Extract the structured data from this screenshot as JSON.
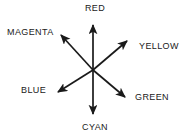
{
  "diagram": {
    "background_color": "#ffffff",
    "line_color": "#1a1a1a",
    "axes": [
      {
        "id": "red",
        "label": "RED",
        "direction": "up",
        "angle_deg": 90,
        "opposite": "cyan"
      },
      {
        "id": "cyan",
        "label": "CYAN",
        "direction": "down",
        "angle_deg": 270,
        "opposite": "red"
      },
      {
        "id": "magenta",
        "label": "MAGENTA",
        "direction": "up-left",
        "angle_deg": 135,
        "opposite": "green"
      },
      {
        "id": "green",
        "label": "GREEN",
        "direction": "down-right",
        "angle_deg": 315,
        "opposite": "magenta"
      },
      {
        "id": "yellow",
        "label": "YELLOW",
        "direction": "up-right",
        "angle_deg": 45,
        "opposite": "blue"
      },
      {
        "id": "blue",
        "label": "BLUE",
        "direction": "down-left",
        "angle_deg": 225,
        "opposite": "yellow"
      }
    ]
  }
}
